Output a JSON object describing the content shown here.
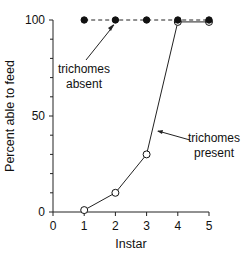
{
  "chart_data": {
    "type": "line",
    "title": "",
    "xlabel": "Instar",
    "ylabel": "Percent able to feed",
    "xlim": [
      0,
      5
    ],
    "ylim": [
      0,
      100
    ],
    "x_ticks": [
      "0",
      "1",
      "2",
      "3",
      "4",
      "5"
    ],
    "y_ticks": [
      "0",
      "50",
      "100"
    ],
    "y_minor_ticks": [
      10,
      20,
      30,
      40,
      60,
      70,
      80,
      90
    ],
    "grid": false,
    "legend": null,
    "x": [
      1,
      2,
      3,
      4,
      5
    ],
    "series": [
      {
        "name": "trichomes absent",
        "values": [
          100,
          100,
          100,
          100,
          100
        ],
        "marker": "filled-circle",
        "line_style": "dashed"
      },
      {
        "name": "trichomes present",
        "values": [
          1,
          10,
          30,
          99,
          99
        ],
        "marker": "open-circle",
        "line_style": "solid"
      }
    ],
    "annotations": [
      {
        "text_lines": [
          "trichomes",
          "absent"
        ],
        "points_to_series": "trichomes absent"
      },
      {
        "text_lines": [
          "trichomes",
          "present"
        ],
        "points_to_series": "trichomes present"
      }
    ]
  }
}
